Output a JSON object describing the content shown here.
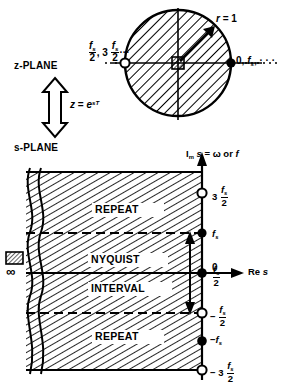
{
  "figure": {
    "planes": {
      "z_plane_label": "z-PLANE",
      "s_plane_label": "s-PLANE",
      "mapping_relation_lhs": "z",
      "mapping_relation_eq": "=",
      "mapping_relation_base": "e",
      "mapping_relation_exponent": "sT"
    },
    "z_plane": {
      "radius_label_name": "r",
      "radius_label_eq": "=",
      "radius_label_value": "1",
      "left_point_labels": {
        "first_num": "f",
        "first_sub": "s",
        "first_den": "2",
        "separator": ",",
        "multiplier": "3",
        "second_num": "f",
        "second_sub": "s",
        "second_den": "2",
        "ellipsis": "···"
      },
      "right_point_label": {
        "zero": "0,",
        "f": "f",
        "sub": "s",
        "ellipsis": ", · · ·"
      }
    },
    "s_plane": {
      "imag_axis_label": {
        "im": "I",
        "im_sub": "m",
        "s": "s",
        "eq": "=",
        "omega": "ω",
        "or": "or",
        "f": "f"
      },
      "real_axis_label": {
        "re": "Re",
        "s": "s"
      },
      "region_labels": [
        "REPEAT",
        "NYQUIST",
        "INTERVAL",
        "REPEAT"
      ],
      "axis_ticks": [
        {
          "multiplier": "3",
          "num": "f",
          "sub": "s",
          "den": "2",
          "sign": "",
          "marker": "open"
        },
        {
          "multiplier": "",
          "num": "f",
          "sub": "s",
          "den": "",
          "sign": "",
          "marker": "filled"
        },
        {
          "multiplier": "",
          "num": "f",
          "sub": "s",
          "den": "2",
          "sign": "",
          "marker": "open"
        },
        {
          "multiplier": "",
          "num": "0",
          "sub": "",
          "den": "",
          "sign": "",
          "marker": "filled"
        },
        {
          "multiplier": "",
          "num": "f",
          "sub": "s",
          "den": "2",
          "sign": "−",
          "marker": "open"
        },
        {
          "multiplier": "",
          "num": "f",
          "sub": "s",
          "den": "",
          "sign": "−",
          "marker": "filled"
        },
        {
          "multiplier": "3",
          "num": "f",
          "sub": "s",
          "den": "2",
          "sign": "−",
          "marker": "open"
        }
      ],
      "infinity_symbol": "∞"
    },
    "colors": {
      "ink": "#000000",
      "paper": "#ffffff"
    }
  }
}
